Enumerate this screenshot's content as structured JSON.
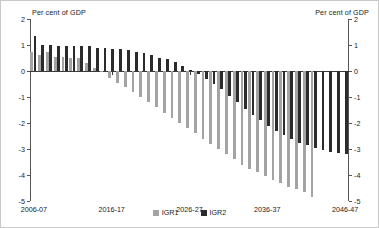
{
  "axis_caption_left": "Per cent of GDP",
  "axis_caption_right": "Per cent of GDP",
  "legend": {
    "items": [
      {
        "label": "IGR1",
        "color": "#a3a3a3"
      },
      {
        "label": "IGR2",
        "color": "#2b2b2b"
      }
    ]
  },
  "chart_data": {
    "type": "bar",
    "title": "",
    "subtitle": "",
    "xlabel": "",
    "ylabel": "Per cent of GDP",
    "ylim": [
      -5,
      2
    ],
    "yticks": [
      2,
      1,
      0,
      -1,
      -2,
      -3,
      -4,
      -5
    ],
    "ytick_labels": [
      "2",
      "1",
      "0",
      "-1",
      "-2",
      "-3",
      "-4",
      "-5"
    ],
    "grid": false,
    "legend_position": "bottom-center",
    "dual_y_axis": true,
    "categories": [
      "2006-07",
      "2007-08",
      "2008-09",
      "2009-10",
      "2010-11",
      "2011-12",
      "2012-13",
      "2013-14",
      "2014-15",
      "2015-16",
      "2016-17",
      "2017-18",
      "2018-19",
      "2019-20",
      "2020-21",
      "2021-22",
      "2022-23",
      "2023-24",
      "2024-25",
      "2025-26",
      "2026-27",
      "2027-28",
      "2028-29",
      "2029-30",
      "2030-31",
      "2031-32",
      "2032-33",
      "2033-34",
      "2034-35",
      "2035-36",
      "2036-37",
      "2037-38",
      "2038-39",
      "2039-40",
      "2040-41",
      "2041-42",
      "2042-43",
      "2043-44",
      "2044-45",
      "2045-46",
      "2046-47"
    ],
    "xtick_labels": [
      "2006-07",
      "2016-17",
      "2026-27",
      "2036-37",
      "2046-47"
    ],
    "xtick_indices": [
      0,
      10,
      20,
      30,
      40
    ],
    "series": [
      {
        "name": "IGR1",
        "color": "#a3a3a3",
        "values": [
          0.75,
          0.6,
          0.75,
          0.55,
          0.55,
          0.5,
          0.5,
          0.3,
          0.1,
          -0.05,
          -0.25,
          -0.45,
          -0.6,
          -0.8,
          -1.0,
          -1.2,
          -1.4,
          -1.6,
          -1.8,
          -2.0,
          -2.2,
          -2.4,
          -2.6,
          -2.8,
          -3.0,
          -3.2,
          -3.4,
          -3.6,
          -3.75,
          -3.9,
          -4.05,
          -4.2,
          -4.3,
          -4.45,
          -4.55,
          -4.65,
          -4.85,
          null,
          null,
          null,
          null
        ]
      },
      {
        "name": "IGR2",
        "color": "#2b2b2b",
        "values": [
          1.35,
          1.0,
          1.0,
          0.95,
          0.95,
          0.95,
          0.95,
          0.95,
          0.9,
          0.9,
          0.85,
          0.85,
          0.8,
          0.75,
          0.7,
          0.6,
          0.5,
          0.45,
          0.35,
          0.2,
          0.05,
          -0.1,
          -0.3,
          -0.5,
          -0.7,
          -0.95,
          -1.2,
          -1.45,
          -1.7,
          -1.9,
          -2.1,
          -2.3,
          -2.45,
          -2.6,
          -2.75,
          -2.85,
          -2.95,
          -3.05,
          -3.1,
          -3.15,
          -3.2
        ]
      }
    ]
  }
}
